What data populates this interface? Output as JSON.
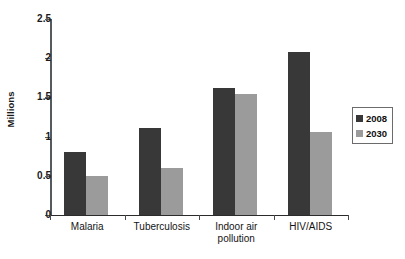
{
  "chart_data": {
    "type": "bar",
    "title": "",
    "subtitle": "",
    "xlabel": "",
    "ylabel": "Millions",
    "categories": [
      "Malaria",
      "Tuberculosis",
      "Indoor air\npollution",
      "HIV/AIDS"
    ],
    "series": [
      {
        "name": "2008",
        "color": "#383838",
        "values": [
          0.8,
          1.11,
          1.62,
          2.08
        ]
      },
      {
        "name": "2030",
        "color": "#9b9b9b",
        "values": [
          0.5,
          0.6,
          1.54,
          1.06
        ]
      }
    ],
    "ylim": [
      0,
      2.5
    ],
    "yticks": [
      0,
      0.5,
      1,
      1.5,
      2,
      2.5
    ],
    "ytick_labels": [
      "0",
      "0.5",
      "1",
      "1.5",
      "2",
      "2.5"
    ],
    "grid": false,
    "legend_position": "right",
    "legend_entries": [
      "2008",
      "2030"
    ]
  }
}
